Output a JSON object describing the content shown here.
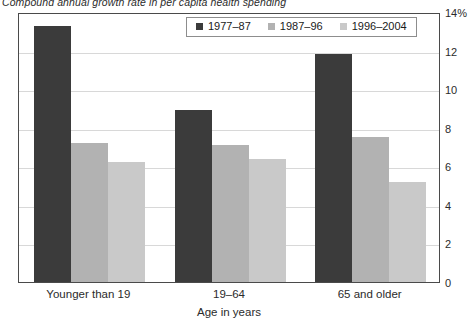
{
  "chart_data": {
    "type": "bar",
    "title": "Compound annual growth rate in per capita health spending",
    "xlabel": "Age in years",
    "ylabel": "",
    "categories": [
      "Younger than 19",
      "19–64",
      "65 and older"
    ],
    "series": [
      {
        "name": "1977–87",
        "color": "#3b3b3b",
        "values": [
          13.3,
          8.9,
          11.8
        ]
      },
      {
        "name": "1987–96",
        "color": "#b2b2b2",
        "values": [
          7.2,
          7.1,
          7.5
        ]
      },
      {
        "name": "1996–2004",
        "color": "#c9c9c9",
        "values": [
          6.2,
          6.4,
          5.2
        ]
      }
    ],
    "ylim": [
      0,
      14
    ],
    "yticks": [
      {
        "value": 14,
        "label": "14%"
      },
      {
        "value": 12,
        "label": "12"
      },
      {
        "value": 10,
        "label": "10"
      },
      {
        "value": 8,
        "label": "8"
      },
      {
        "value": 6,
        "label": "6"
      },
      {
        "value": 4,
        "label": "4"
      },
      {
        "value": 2,
        "label": "2"
      },
      {
        "value": 0,
        "label": "0"
      }
    ],
    "grid": true,
    "legend_position": "top-center",
    "y_unit": "%"
  },
  "colors": {
    "frame": "#4a4a4a",
    "gridline": "#d8d8d8",
    "text": "#2b2b2b",
    "background": "#ffffff"
  }
}
